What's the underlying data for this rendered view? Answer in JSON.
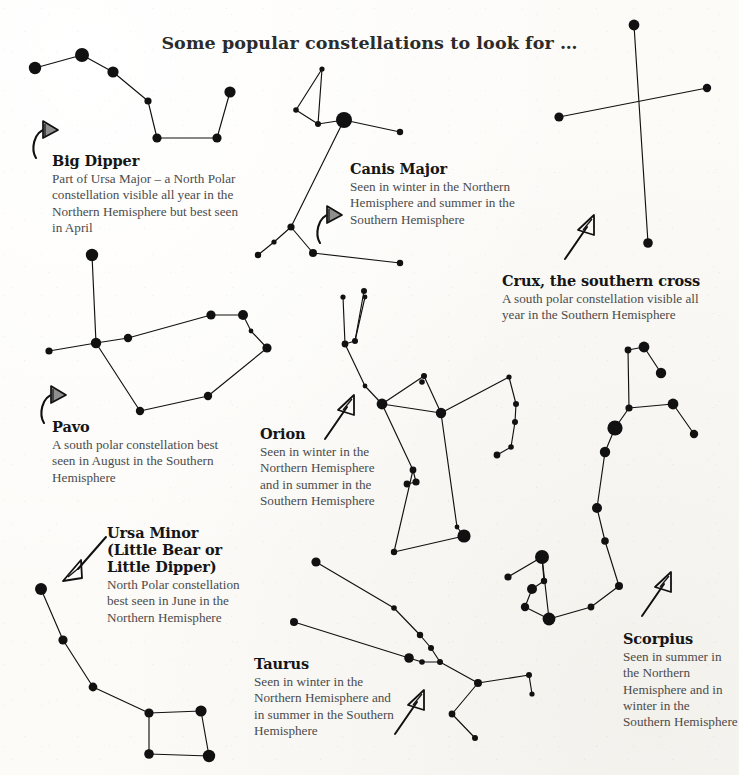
{
  "page": {
    "title": "Some popular constellations to look for …",
    "background_color": "#fcfbf8",
    "ink_color": "#111111",
    "text_color": "#4b4b4b"
  },
  "constellations": [
    {
      "id": "big-dipper",
      "name": "Big Dipper",
      "description": "Part of Ursa Major – a North Polar constellation visible all year in the Northern Hemisphere but best seen in April",
      "label_x": 52,
      "label_y": 152,
      "label_w": 195,
      "pointer": {
        "type": "curved-hook-arrow",
        "x": 34,
        "y": 120
      },
      "stars": [
        {
          "x": 35,
          "y": 68,
          "r": 6.2
        },
        {
          "x": 82,
          "y": 55,
          "r": 7.0
        },
        {
          "x": 113,
          "y": 72,
          "r": 5.6
        },
        {
          "x": 148,
          "y": 101,
          "r": 3.6
        },
        {
          "x": 157,
          "y": 138,
          "r": 4.6
        },
        {
          "x": 217,
          "y": 138,
          "r": 4.6
        },
        {
          "x": 230,
          "y": 92,
          "r": 5.6
        }
      ],
      "lines": [
        [
          0,
          1
        ],
        [
          1,
          2
        ],
        [
          2,
          3
        ],
        [
          3,
          4
        ],
        [
          4,
          5
        ],
        [
          5,
          6
        ]
      ]
    },
    {
      "id": "canis-major",
      "name": "Canis Major",
      "description": "Seen in winter in the Northern Hemisphere and summer in the Southern Hemisphere",
      "label_x": 350,
      "label_y": 160,
      "label_w": 176,
      "pointer": {
        "type": "curved-hook-arrow",
        "x": 318,
        "y": 205
      },
      "stars": [
        {
          "x": 322,
          "y": 69,
          "r": 2.6
        },
        {
          "x": 296,
          "y": 110,
          "r": 2.8
        },
        {
          "x": 318,
          "y": 124,
          "r": 3.0
        },
        {
          "x": 344,
          "y": 120,
          "r": 8.0
        },
        {
          "x": 400,
          "y": 132,
          "r": 3.2
        },
        {
          "x": 291,
          "y": 227,
          "r": 3.6
        },
        {
          "x": 274,
          "y": 242,
          "r": 2.6
        },
        {
          "x": 258,
          "y": 255,
          "r": 3.2
        },
        {
          "x": 313,
          "y": 253,
          "r": 4.0
        },
        {
          "x": 400,
          "y": 263,
          "r": 3.2
        }
      ],
      "lines": [
        [
          0,
          1
        ],
        [
          1,
          2
        ],
        [
          2,
          0
        ],
        [
          2,
          3
        ],
        [
          3,
          4
        ],
        [
          3,
          5
        ],
        [
          5,
          6
        ],
        [
          6,
          7
        ],
        [
          5,
          8
        ],
        [
          8,
          9
        ]
      ]
    },
    {
      "id": "crux",
      "name": "Crux, the southern cross",
      "description": "A south polar constellation visible all year in the Southern Hemisphere",
      "label_x": 502,
      "label_y": 272,
      "label_w": 220,
      "pointer": {
        "type": "straight-arrow-up-right",
        "x": 565,
        "y": 215
      },
      "stars": [
        {
          "x": 634,
          "y": 25,
          "r": 5.4
        },
        {
          "x": 648,
          "y": 243,
          "r": 4.8
        },
        {
          "x": 559,
          "y": 117,
          "r": 4.6
        },
        {
          "x": 707,
          "y": 88,
          "r": 4.2
        }
      ],
      "lines": [
        [
          0,
          1
        ],
        [
          2,
          3
        ]
      ]
    },
    {
      "id": "pavo",
      "name": "Pavo",
      "description": "A south polar constellation best seen in August in the Southern Hemisphere",
      "label_x": 52,
      "label_y": 418,
      "label_w": 185,
      "pointer": {
        "type": "curved-hook-arrow",
        "x": 42,
        "y": 385
      },
      "stars": [
        {
          "x": 92,
          "y": 255,
          "r": 6.2
        },
        {
          "x": 96,
          "y": 343,
          "r": 5.2
        },
        {
          "x": 49,
          "y": 351,
          "r": 3.6
        },
        {
          "x": 128,
          "y": 338,
          "r": 4.2
        },
        {
          "x": 211,
          "y": 315,
          "r": 4.6
        },
        {
          "x": 243,
          "y": 315,
          "r": 5.0
        },
        {
          "x": 251,
          "y": 331,
          "r": 2.4
        },
        {
          "x": 267,
          "y": 348,
          "r": 4.6
        },
        {
          "x": 208,
          "y": 396,
          "r": 4.2
        },
        {
          "x": 140,
          "y": 411,
          "r": 4.2
        }
      ],
      "lines": [
        [
          0,
          1
        ],
        [
          1,
          2
        ],
        [
          1,
          3
        ],
        [
          3,
          4
        ],
        [
          4,
          5
        ],
        [
          5,
          6
        ],
        [
          6,
          7
        ],
        [
          7,
          8
        ],
        [
          8,
          9
        ],
        [
          9,
          1
        ]
      ]
    },
    {
      "id": "orion",
      "name": "Orion",
      "description": "Seen in winter in the Northern Hemisphere and in summer in the Southern Hemisphere",
      "label_x": 260,
      "label_y": 425,
      "label_w": 130,
      "pointer": {
        "type": "straight-arrow-up-right",
        "x": 325,
        "y": 395
      },
      "stars": [
        {
          "x": 343,
          "y": 297,
          "r": 2.6
        },
        {
          "x": 364,
          "y": 291,
          "r": 3.0
        },
        {
          "x": 365,
          "y": 297,
          "r": 2.4
        },
        {
          "x": 345,
          "y": 344,
          "r": 3.4
        },
        {
          "x": 355,
          "y": 341,
          "r": 3.0
        },
        {
          "x": 365,
          "y": 386,
          "r": 2.4
        },
        {
          "x": 382,
          "y": 404,
          "r": 5.4
        },
        {
          "x": 422,
          "y": 382,
          "r": 2.8
        },
        {
          "x": 424,
          "y": 376,
          "r": 3.0
        },
        {
          "x": 441,
          "y": 413,
          "r": 5.2
        },
        {
          "x": 509,
          "y": 377,
          "r": 2.6
        },
        {
          "x": 516,
          "y": 404,
          "r": 3.0
        },
        {
          "x": 515,
          "y": 422,
          "r": 3.0
        },
        {
          "x": 511,
          "y": 447,
          "r": 2.8
        },
        {
          "x": 497,
          "y": 455,
          "r": 3.4
        },
        {
          "x": 413,
          "y": 470,
          "r": 3.4
        },
        {
          "x": 416,
          "y": 482,
          "r": 3.6
        },
        {
          "x": 407,
          "y": 484,
          "r": 3.4
        },
        {
          "x": 457,
          "y": 527,
          "r": 2.4
        },
        {
          "x": 464,
          "y": 536,
          "r": 6.6
        },
        {
          "x": 394,
          "y": 552,
          "r": 3.2
        }
      ],
      "lines": [
        [
          0,
          3
        ],
        [
          1,
          4
        ],
        [
          2,
          4
        ],
        [
          3,
          4
        ],
        [
          3,
          5
        ],
        [
          5,
          6
        ],
        [
          6,
          8
        ],
        [
          8,
          9
        ],
        [
          9,
          10
        ],
        [
          9,
          6
        ],
        [
          10,
          11
        ],
        [
          11,
          12
        ],
        [
          12,
          13
        ],
        [
          13,
          14
        ],
        [
          6,
          15
        ],
        [
          15,
          16
        ],
        [
          16,
          17
        ],
        [
          9,
          18
        ],
        [
          18,
          19
        ],
        [
          19,
          20
        ],
        [
          20,
          15
        ]
      ]
    },
    {
      "id": "scorpius",
      "name": "Scorpius",
      "description": "Seen in summer in the Northern Hemisphere and in winter in the Southern Hemisphere",
      "label_x": 623,
      "label_y": 630,
      "label_w": 116,
      "pointer": {
        "type": "straight-arrow-up-right",
        "x": 642,
        "y": 572
      },
      "stars": [
        {
          "x": 628,
          "y": 350,
          "r": 3.4
        },
        {
          "x": 644,
          "y": 347,
          "r": 5.4
        },
        {
          "x": 661,
          "y": 373,
          "r": 5.2
        },
        {
          "x": 629,
          "y": 408,
          "r": 3.6
        },
        {
          "x": 673,
          "y": 404,
          "r": 5.4
        },
        {
          "x": 694,
          "y": 434,
          "r": 4.2
        },
        {
          "x": 615,
          "y": 428,
          "r": 7.6
        },
        {
          "x": 605,
          "y": 452,
          "r": 5.2
        },
        {
          "x": 597,
          "y": 508,
          "r": 5.0
        },
        {
          "x": 605,
          "y": 541,
          "r": 3.8
        },
        {
          "x": 619,
          "y": 586,
          "r": 4.0
        },
        {
          "x": 591,
          "y": 607,
          "r": 3.4
        },
        {
          "x": 549,
          "y": 619,
          "r": 6.4
        },
        {
          "x": 542,
          "y": 557,
          "r": 7.0
        },
        {
          "x": 508,
          "y": 577,
          "r": 3.6
        },
        {
          "x": 544,
          "y": 581,
          "r": 3.2
        },
        {
          "x": 532,
          "y": 589,
          "r": 5.0
        },
        {
          "x": 525,
          "y": 607,
          "r": 4.2
        }
      ],
      "lines": [
        [
          0,
          1
        ],
        [
          1,
          2
        ],
        [
          0,
          3
        ],
        [
          3,
          4
        ],
        [
          4,
          5
        ],
        [
          3,
          6
        ],
        [
          6,
          7
        ],
        [
          7,
          8
        ],
        [
          8,
          9
        ],
        [
          9,
          10
        ],
        [
          10,
          11
        ],
        [
          11,
          12
        ],
        [
          12,
          13
        ],
        [
          13,
          14
        ],
        [
          13,
          15
        ],
        [
          15,
          16
        ],
        [
          16,
          17
        ],
        [
          17,
          12
        ]
      ]
    },
    {
      "id": "ursa-minor",
      "name": "Ursa Minor\n(Little Bear or\nLittle Dipper)",
      "description": "North Polar constellation best seen in June in the Northern Hemisphere",
      "label_x": 107,
      "label_y": 524,
      "label_w": 140,
      "pointer": {
        "type": "straight-arrow-down-left",
        "x": 62,
        "y": 545
      },
      "stars": [
        {
          "x": 41,
          "y": 589,
          "r": 6.0
        },
        {
          "x": 63,
          "y": 640,
          "r": 4.6
        },
        {
          "x": 93,
          "y": 687,
          "r": 4.4
        },
        {
          "x": 149,
          "y": 713,
          "r": 4.6
        },
        {
          "x": 201,
          "y": 711,
          "r": 5.6
        },
        {
          "x": 209,
          "y": 756,
          "r": 6.2
        },
        {
          "x": 149,
          "y": 754,
          "r": 4.8
        }
      ],
      "lines": [
        [
          0,
          1
        ],
        [
          1,
          2
        ],
        [
          2,
          3
        ],
        [
          3,
          4
        ],
        [
          4,
          5
        ],
        [
          5,
          6
        ],
        [
          6,
          3
        ]
      ]
    },
    {
      "id": "taurus",
      "name": "Taurus",
      "description": "Seen in winter in the Northern Hemisphere and in summer in the Southern Hemisphere",
      "label_x": 254,
      "label_y": 655,
      "label_w": 140,
      "pointer": {
        "type": "straight-arrow-up-right",
        "x": 395,
        "y": 690
      },
      "stars": [
        {
          "x": 316,
          "y": 562,
          "r": 4.6
        },
        {
          "x": 394,
          "y": 608,
          "r": 2.8
        },
        {
          "x": 420,
          "y": 635,
          "r": 3.2
        },
        {
          "x": 431,
          "y": 648,
          "r": 3.0
        },
        {
          "x": 440,
          "y": 662,
          "r": 3.0
        },
        {
          "x": 422,
          "y": 662,
          "r": 2.8
        },
        {
          "x": 409,
          "y": 658,
          "r": 4.8
        },
        {
          "x": 294,
          "y": 622,
          "r": 4.0
        },
        {
          "x": 478,
          "y": 683,
          "r": 4.0
        },
        {
          "x": 529,
          "y": 675,
          "r": 3.0
        },
        {
          "x": 532,
          "y": 694,
          "r": 2.6
        },
        {
          "x": 452,
          "y": 714,
          "r": 3.4
        },
        {
          "x": 475,
          "y": 738,
          "r": 3.0
        }
      ],
      "lines": [
        [
          0,
          1
        ],
        [
          1,
          2
        ],
        [
          2,
          3
        ],
        [
          3,
          4
        ],
        [
          4,
          5
        ],
        [
          5,
          6
        ],
        [
          6,
          7
        ],
        [
          4,
          8
        ],
        [
          8,
          9
        ],
        [
          9,
          10
        ],
        [
          8,
          11
        ],
        [
          11,
          12
        ]
      ]
    }
  ]
}
